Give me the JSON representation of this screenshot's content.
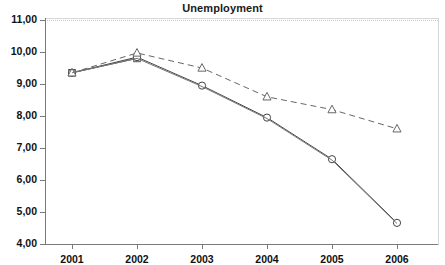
{
  "chart_data": {
    "type": "line",
    "title": "Unemployment",
    "xlabel": "",
    "ylabel": "",
    "categories": [
      "2001",
      "2002",
      "2003",
      "2004",
      "2005",
      "2006"
    ],
    "ylim": [
      4.0,
      11.0
    ],
    "ytick_labels": [
      "11,00",
      "10,00",
      "9,00",
      "8,00",
      "7,00",
      "6,00",
      "5,00",
      "4,00"
    ],
    "ytick_values": [
      11.0,
      10.0,
      9.0,
      8.0,
      7.0,
      6.0,
      5.0,
      4.0
    ],
    "grid": false,
    "legend_position": "none",
    "decimal_separator": ",",
    "series": [
      {
        "name": "series-square",
        "marker": "square",
        "line_style": "solid",
        "color": "#555555",
        "values": [
          9.35,
          9.8,
          null,
          null,
          null,
          null
        ]
      },
      {
        "name": "series-circle",
        "marker": "circle",
        "line_style": "solid",
        "color": "#444444",
        "values": [
          9.35,
          9.84,
          8.95,
          7.95,
          6.65,
          4.66
        ]
      },
      {
        "name": "series-triangle",
        "marker": "triangle",
        "line_style": "dashed",
        "color": "#666666",
        "values": [
          9.35,
          9.97,
          9.5,
          8.6,
          8.2,
          7.6
        ]
      },
      {
        "name": "series-thin-solid",
        "marker": "none",
        "line_style": "solid",
        "color": "#777777",
        "values": [
          9.35,
          9.8,
          8.92,
          7.92,
          6.62,
          4.64
        ]
      }
    ]
  },
  "axes": {
    "x_axis_name": "year-axis",
    "y_axis_name": "unemployment-rate-axis"
  }
}
